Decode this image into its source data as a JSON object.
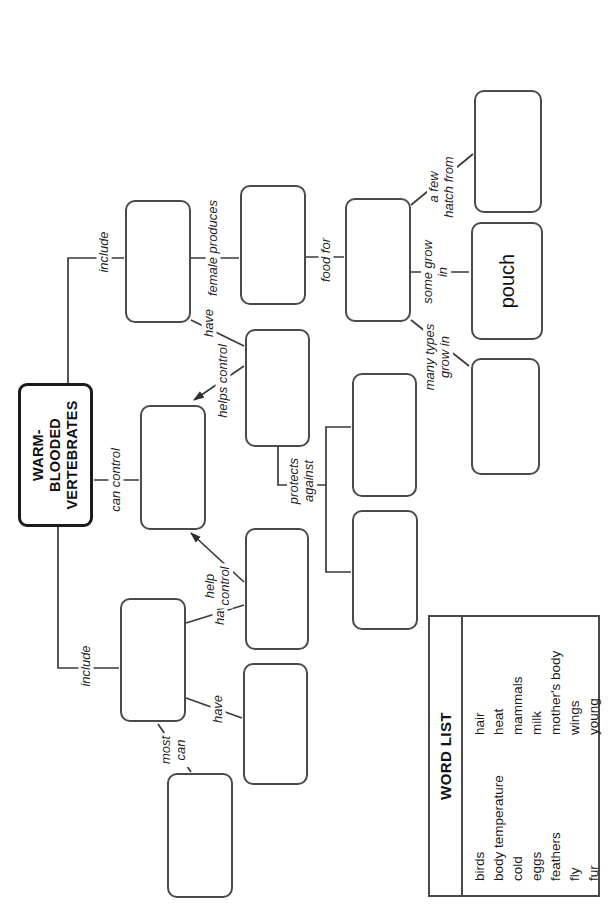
{
  "diagram": {
    "title": "WARM-\nBLOODED\nVERTEBRATES",
    "ink_color": "#3a3a3a",
    "filled_boxes": {
      "pouch": "pouch"
    },
    "labels": {
      "include_left": "include",
      "include_right": "include",
      "can_control": "can control",
      "most_can": "most\ncan",
      "have_wings": "have",
      "have_feathers": "have",
      "have_mammals": "have",
      "help_control": "help\ncontrol",
      "helps_control": "helps control",
      "female_produces": "female produces",
      "food_for": "food for",
      "protects_against": "protects\nagainst",
      "many_types_grow_in": "many types\ngrow in",
      "some_grow_in": "some grow\nin",
      "a_few_hatch_from": "a few\nhatch from"
    }
  },
  "word_list": {
    "header": "WORD LIST",
    "column1": [
      "birds",
      "body temperature",
      "cold",
      "eggs",
      "feathers",
      "fly",
      "fur"
    ],
    "column2": [
      "hair",
      "heat",
      "mammals",
      "milk",
      "mother's body",
      "wings",
      "young"
    ]
  }
}
